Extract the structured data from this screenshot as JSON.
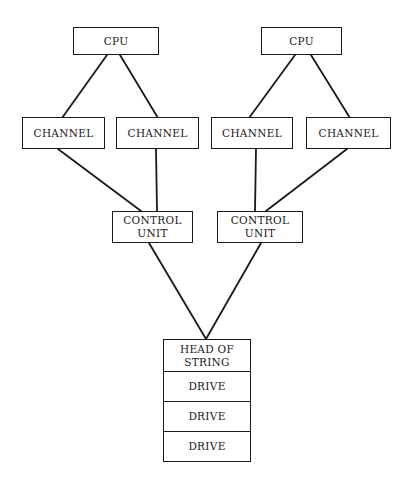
{
  "diagram": {
    "cpus": [
      {
        "id": "cpu-left",
        "label": "CPU"
      },
      {
        "id": "cpu-right",
        "label": "CPU"
      }
    ],
    "channels": [
      {
        "id": "channel-1",
        "label": "CHANNEL"
      },
      {
        "id": "channel-2",
        "label": "CHANNEL"
      },
      {
        "id": "channel-3",
        "label": "CHANNEL"
      },
      {
        "id": "channel-4",
        "label": "CHANNEL"
      }
    ],
    "control_units": [
      {
        "id": "control-unit-left",
        "label": "CONTROL\nUNIT"
      },
      {
        "id": "control-unit-right",
        "label": "CONTROL\nUNIT"
      }
    ],
    "string": {
      "head": "HEAD OF\nSTRING",
      "drives": [
        "DRIVE",
        "DRIVE",
        "DRIVE"
      ]
    },
    "connections": [
      [
        "cpu-left",
        "channel-1"
      ],
      [
        "cpu-left",
        "channel-2"
      ],
      [
        "cpu-right",
        "channel-3"
      ],
      [
        "cpu-right",
        "channel-4"
      ],
      [
        "channel-1",
        "control-unit-left"
      ],
      [
        "channel-2",
        "control-unit-left"
      ],
      [
        "channel-3",
        "control-unit-right"
      ],
      [
        "channel-4",
        "control-unit-right"
      ],
      [
        "control-unit-left",
        "head-of-string"
      ],
      [
        "control-unit-right",
        "head-of-string"
      ]
    ]
  }
}
